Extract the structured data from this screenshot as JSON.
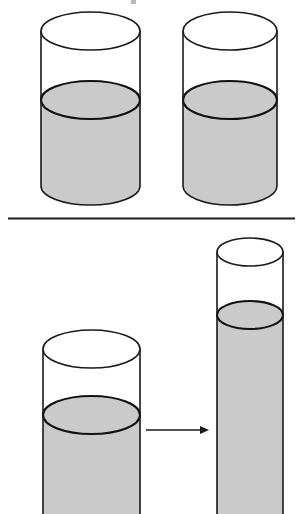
{
  "figure": {
    "background_color": "#ffffff",
    "width": 300,
    "height": 514,
    "outline_color": "#1a1a1a",
    "liquid_color": "#cacaca",
    "empty_color": "#ffffff"
  },
  "panels": [
    {
      "id": "top-panel",
      "name": "identical-glasses-panel",
      "caption": "",
      "objects": [
        {
          "id": "top-glass-left",
          "name": "cylinder-glass-left",
          "shape": "cylinder",
          "label": "",
          "liquid_fill_label": "",
          "left": 41,
          "right": 140,
          "top_y": 12,
          "bottom_y": 205,
          "liquid_level_y": 100,
          "ellipse_ry": 19,
          "liquid_color": "#cacaca"
        },
        {
          "id": "top-glass-right",
          "name": "cylinder-glass-right",
          "shape": "cylinder",
          "label": "",
          "liquid_fill_label": "",
          "left": 183,
          "right": 277,
          "top_y": 12,
          "bottom_y": 205,
          "liquid_level_y": 100,
          "ellipse_ry": 19,
          "liquid_color": "#cacaca"
        }
      ]
    },
    {
      "id": "bottom-panel",
      "name": "pour-transformation-panel",
      "caption": "",
      "objects": [
        {
          "id": "bottom-glass-wide",
          "name": "cylinder-glass-wide",
          "shape": "cylinder",
          "label": "",
          "liquid_fill_label": "",
          "left": 43,
          "right": 140,
          "top_y": 330,
          "bottom_y": 520,
          "liquid_level_y": 415,
          "ellipse_ry": 19,
          "liquid_color": "#cacaca"
        },
        {
          "id": "bottom-glass-tall",
          "name": "cylinder-glass-tall-narrow",
          "shape": "cylinder",
          "label": "",
          "liquid_fill_label": "",
          "left": 217,
          "right": 283,
          "top_y": 238,
          "bottom_y": 520,
          "liquid_level_y": 315,
          "ellipse_ry": 14,
          "liquid_color": "#cacaca"
        }
      ],
      "arrow": {
        "id": "pour-arrow",
        "name": "transformation-arrow",
        "label": "",
        "direction": "right",
        "x_start": 146,
        "x_end": 209,
        "y": 430
      }
    }
  ],
  "divider": {
    "id": "panel-divider",
    "name": "horizontal-divider-rule",
    "x_start": 8,
    "x_end": 295,
    "y": 218,
    "thickness": 2,
    "color": "#1f1f1f"
  },
  "crop_artifact": {
    "name": "top-crop-mark",
    "x": 131,
    "y": 0,
    "width": 6,
    "height": 4
  }
}
